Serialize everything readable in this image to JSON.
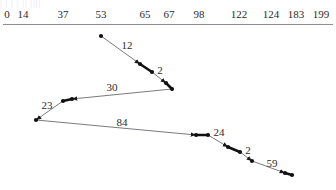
{
  "figure": {
    "type": "path-trajectory-diagram",
    "top_clipped_text": "|  | | | || ||||",
    "stroke_color": "#6b6b70",
    "node_color": "#111111",
    "text_color": "#2b2b2b",
    "axis_color": "#8d8d93",
    "background": "#ffffff"
  },
  "axis": {
    "name": "top-numeric-ruler",
    "orientation": "horizontal",
    "line_y": 24,
    "ticks": [
      {
        "label": "0",
        "x": 7
      },
      {
        "label": "14",
        "x": 23
      },
      {
        "label": "37",
        "x": 63
      },
      {
        "label": "53",
        "x": 101
      },
      {
        "label": "65",
        "x": 145
      },
      {
        "label": "67",
        "x": 169
      },
      {
        "label": "98",
        "x": 199
      },
      {
        "label": "122",
        "x": 239
      },
      {
        "label": "124",
        "x": 271
      },
      {
        "label": "183",
        "x": 296
      },
      {
        "label": "199",
        "x": 321
      }
    ]
  },
  "chart_data": {
    "type": "line",
    "title": "",
    "xlabel": "",
    "ylabel": "",
    "grid": false,
    "legend": null,
    "axis_ticks": [
      0,
      14,
      37,
      53,
      65,
      67,
      98,
      122,
      124,
      183,
      199
    ],
    "nodes": [
      {
        "id": "n0",
        "x": 101,
        "y": 36
      },
      {
        "id": "n1",
        "x": 140,
        "y": 64
      },
      {
        "id": "n2",
        "x": 152,
        "y": 72
      },
      {
        "id": "n3",
        "x": 166,
        "y": 83
      },
      {
        "id": "n4",
        "x": 172,
        "y": 89
      },
      {
        "id": "n5",
        "x": 72,
        "y": 99
      },
      {
        "id": "n6",
        "x": 63,
        "y": 101
      },
      {
        "id": "n7",
        "x": 36,
        "y": 120
      },
      {
        "id": "n8",
        "x": 196,
        "y": 135
      },
      {
        "id": "n9",
        "x": 208,
        "y": 135
      },
      {
        "id": "n10",
        "x": 228,
        "y": 147
      },
      {
        "id": "n11",
        "x": 240,
        "y": 152
      },
      {
        "id": "n12",
        "x": 252,
        "y": 161
      },
      {
        "id": "n13",
        "x": 285,
        "y": 173
      },
      {
        "id": "n14",
        "x": 292,
        "y": 175
      }
    ],
    "segments": [
      {
        "from": "n0",
        "to": "n1",
        "label": "12",
        "label_x": 127,
        "label_y": 45,
        "arrow": true
      },
      {
        "from": "n1",
        "to": "n2",
        "label": "",
        "arrow": false
      },
      {
        "from": "n2",
        "to": "n3",
        "label": "2",
        "label_x": 160,
        "label_y": 70,
        "arrow": true
      },
      {
        "from": "n3",
        "to": "n4",
        "label": "",
        "arrow": false
      },
      {
        "from": "n4",
        "to": "n5",
        "label": "30",
        "label_x": 112,
        "label_y": 87,
        "arrow": true
      },
      {
        "from": "n5",
        "to": "n6",
        "label": "",
        "arrow": false
      },
      {
        "from": "n6",
        "to": "n7",
        "label": "23",
        "label_x": 47,
        "label_y": 105,
        "arrow": true
      },
      {
        "from": "n7",
        "to": "n8",
        "label": "84",
        "label_x": 122,
        "label_y": 122,
        "arrow": true
      },
      {
        "from": "n8",
        "to": "n9",
        "label": "",
        "arrow": false
      },
      {
        "from": "n9",
        "to": "n10",
        "label": "24",
        "label_x": 219,
        "label_y": 132,
        "arrow": true
      },
      {
        "from": "n10",
        "to": "n11",
        "label": "",
        "arrow": false
      },
      {
        "from": "n11",
        "to": "n12",
        "label": "2",
        "label_x": 248,
        "label_y": 150,
        "arrow": true
      },
      {
        "from": "n12",
        "to": "n13",
        "label": "59",
        "label_x": 272,
        "label_y": 163,
        "arrow": true
      },
      {
        "from": "n13",
        "to": "n14",
        "label": "",
        "arrow": false
      }
    ],
    "edge_labels": [
      "12",
      "2",
      "30",
      "23",
      "84",
      "24",
      "2",
      "59"
    ]
  }
}
